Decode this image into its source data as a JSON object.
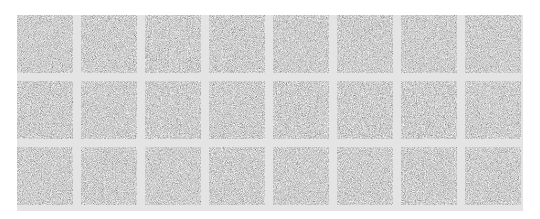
{
  "image": {
    "description": "Grid of gray noise-texture tiles",
    "background_color": "#ffffff",
    "panel_color": "#e4e4e4",
    "tile_base_color": "#9c9c9c",
    "rows": 3,
    "columns": 8,
    "tiles": [
      {
        "row": 1,
        "col": 1,
        "seed": 1
      },
      {
        "row": 1,
        "col": 2,
        "seed": 2
      },
      {
        "row": 1,
        "col": 3,
        "seed": 3
      },
      {
        "row": 1,
        "col": 4,
        "seed": 4
      },
      {
        "row": 1,
        "col": 5,
        "seed": 5
      },
      {
        "row": 1,
        "col": 6,
        "seed": 6
      },
      {
        "row": 1,
        "col": 7,
        "seed": 7
      },
      {
        "row": 1,
        "col": 8,
        "seed": 8
      },
      {
        "row": 2,
        "col": 1,
        "seed": 9
      },
      {
        "row": 2,
        "col": 2,
        "seed": 10
      },
      {
        "row": 2,
        "col": 3,
        "seed": 11
      },
      {
        "row": 2,
        "col": 4,
        "seed": 12
      },
      {
        "row": 2,
        "col": 5,
        "seed": 13
      },
      {
        "row": 2,
        "col": 6,
        "seed": 14
      },
      {
        "row": 2,
        "col": 7,
        "seed": 15
      },
      {
        "row": 2,
        "col": 8,
        "seed": 16
      },
      {
        "row": 3,
        "col": 1,
        "seed": 17
      },
      {
        "row": 3,
        "col": 2,
        "seed": 18
      },
      {
        "row": 3,
        "col": 3,
        "seed": 19
      },
      {
        "row": 3,
        "col": 4,
        "seed": 20
      },
      {
        "row": 3,
        "col": 5,
        "seed": 21
      },
      {
        "row": 3,
        "col": 6,
        "seed": 22
      },
      {
        "row": 3,
        "col": 7,
        "seed": 23
      },
      {
        "row": 3,
        "col": 8,
        "seed": 24
      }
    ]
  }
}
